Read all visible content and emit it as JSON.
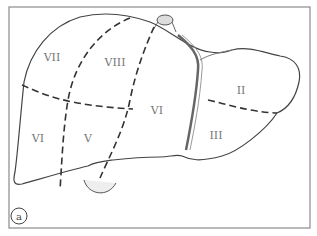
{
  "figure": {
    "panel_label": "a",
    "segments": [
      {
        "id": "VII",
        "label": "VII"
      },
      {
        "id": "VIII",
        "label": "VIII"
      },
      {
        "id": "VI-upper-mid",
        "label": "VI"
      },
      {
        "id": "II",
        "label": "II"
      },
      {
        "id": "VI-left",
        "label": "VI"
      },
      {
        "id": "V",
        "label": "V"
      },
      {
        "id": "III",
        "label": "III"
      }
    ]
  }
}
